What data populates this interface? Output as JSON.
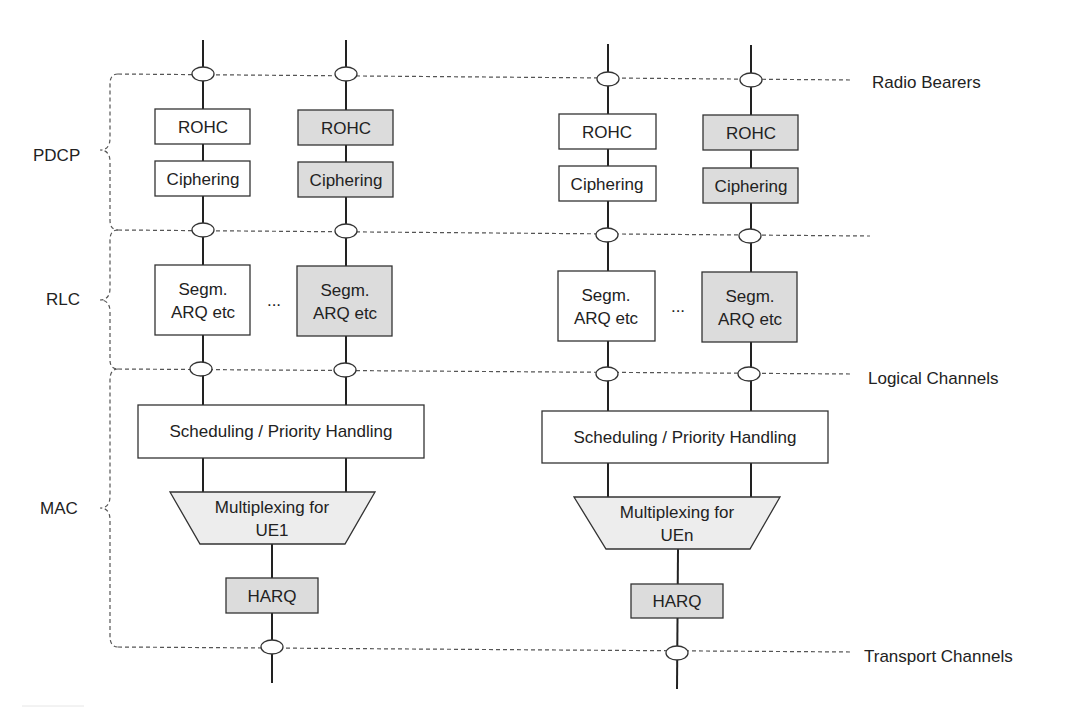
{
  "colors": {
    "plain_fill": "#ffffff",
    "shaded_fill": "#dcdcdc",
    "mux_fill": "#ededed",
    "line": "#222222"
  },
  "layers": {
    "pdcp": "PDCP",
    "rlc": "RLC",
    "mac": "MAC"
  },
  "channels": {
    "radio_bearers": "Radio Bearers",
    "logical_channels": "Logical Channels",
    "transport_channels": "Transport Channels"
  },
  "ue1": {
    "bearer1": {
      "rohc": "ROHC",
      "ciphering": "Ciphering",
      "rlc_line1": "Segm.",
      "rlc_line2": "ARQ etc"
    },
    "ellipsis": "...",
    "bearer2": {
      "rohc": "ROHC",
      "ciphering": "Ciphering",
      "rlc_line1": "Segm.",
      "rlc_line2": "ARQ etc"
    },
    "scheduling": "Scheduling / Priority Handling",
    "mux_line1": "Multiplexing for",
    "mux_line2": "UE1",
    "harq": "HARQ"
  },
  "uen": {
    "bearer1": {
      "rohc": "ROHC",
      "ciphering": "Ciphering",
      "rlc_line1": "Segm.",
      "rlc_line2": "ARQ etc"
    },
    "ellipsis": "...",
    "bearer2": {
      "rohc": "ROHC",
      "ciphering": "Ciphering",
      "rlc_line1": "Segm.",
      "rlc_line2": "ARQ etc"
    },
    "scheduling": "Scheduling / Priority Handling",
    "mux_line1": "Multiplexing for",
    "mux_line2": "UEn",
    "harq": "HARQ"
  }
}
